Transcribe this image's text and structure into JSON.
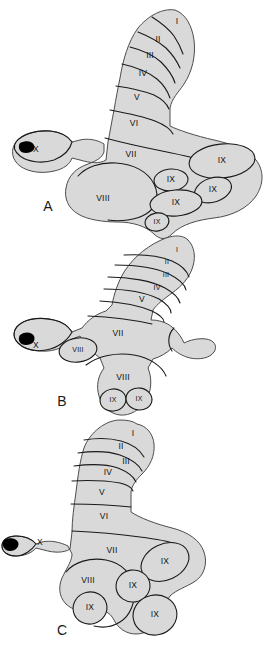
{
  "figure": {
    "background_color": "#ffffff",
    "fill_color": "#d9d9d9",
    "outline_color": "#4d4d4d",
    "fissure_color": "#1a1a1a",
    "nodulus_color": "#000000",
    "label_color": "#111111"
  },
  "panels": [
    {
      "id": "A",
      "label": "A",
      "label_x": 48,
      "label_y": 207,
      "lobules": [
        {
          "name": "I",
          "text": "I",
          "x": 177,
          "y": 22,
          "size": "normal"
        },
        {
          "name": "II",
          "text": "II",
          "x": 158,
          "y": 40,
          "size": "normal"
        },
        {
          "name": "III",
          "text": "III",
          "x": 150,
          "y": 56,
          "size": "normal"
        },
        {
          "name": "IV",
          "text": "IV",
          "x": 143,
          "y": 74,
          "size": "normal"
        },
        {
          "name": "V",
          "text": "V",
          "x": 137,
          "y": 98,
          "size": "normal"
        },
        {
          "name": "VI",
          "text": "VI",
          "x": 134,
          "y": 124,
          "size": "normal"
        },
        {
          "name": "VII",
          "text": "VII",
          "x": 131,
          "y": 155,
          "size": "normal"
        },
        {
          "name": "VIII",
          "text": "VIII",
          "x": 103,
          "y": 199,
          "size": "normal"
        },
        {
          "name": "X",
          "text": "X",
          "x": 36,
          "y": 150,
          "size": "normal"
        },
        {
          "name": "IX-1",
          "text": "IX",
          "x": 222,
          "y": 161,
          "size": "normal"
        },
        {
          "name": "IX-2",
          "text": "IX",
          "x": 171,
          "y": 180,
          "size": "normal"
        },
        {
          "name": "IX-3",
          "text": "IX",
          "x": 213,
          "y": 190,
          "size": "normal"
        },
        {
          "name": "IX-4",
          "text": "IX",
          "x": 176,
          "y": 203,
          "size": "normal"
        },
        {
          "name": "IX-5",
          "text": "IX",
          "x": 157,
          "y": 222,
          "size": "sm"
        }
      ]
    },
    {
      "id": "B",
      "label": "B",
      "label_x": 62,
      "label_y": 402,
      "lobules": [
        {
          "name": "I",
          "text": "I",
          "x": 177,
          "y": 250,
          "size": "sm"
        },
        {
          "name": "II",
          "text": "II",
          "x": 167,
          "y": 262,
          "size": "sm"
        },
        {
          "name": "III",
          "text": "III",
          "x": 166,
          "y": 275,
          "size": "sm"
        },
        {
          "name": "IV",
          "text": "IV",
          "x": 157,
          "y": 288,
          "size": "sm"
        },
        {
          "name": "V",
          "text": "V",
          "x": 142,
          "y": 300,
          "size": "normal"
        },
        {
          "name": "VII",
          "text": "VII",
          "x": 118,
          "y": 334,
          "size": "normal"
        },
        {
          "name": "VIII-1",
          "text": "VIII",
          "x": 78,
          "y": 350,
          "size": "sm"
        },
        {
          "name": "X",
          "text": "X",
          "x": 36,
          "y": 346,
          "size": "normal"
        },
        {
          "name": "VIII-2",
          "text": "VIII",
          "x": 123,
          "y": 378,
          "size": "normal"
        },
        {
          "name": "IX-1",
          "text": "IX",
          "x": 113,
          "y": 400,
          "size": "sm"
        },
        {
          "name": "IX-2",
          "text": "IX",
          "x": 139,
          "y": 399,
          "size": "sm"
        }
      ]
    },
    {
      "id": "C",
      "label": "C",
      "label_x": 62,
      "label_y": 631,
      "lobules": [
        {
          "name": "I",
          "text": "I",
          "x": 133,
          "y": 434,
          "size": "normal"
        },
        {
          "name": "II",
          "text": "II",
          "x": 121,
          "y": 447,
          "size": "normal"
        },
        {
          "name": "III",
          "text": "III",
          "x": 126,
          "y": 462,
          "size": "normal"
        },
        {
          "name": "IV",
          "text": "IV",
          "x": 108,
          "y": 473,
          "size": "normal"
        },
        {
          "name": "V",
          "text": "V",
          "x": 102,
          "y": 493,
          "size": "normal"
        },
        {
          "name": "VI",
          "text": "VI",
          "x": 104,
          "y": 517,
          "size": "normal"
        },
        {
          "name": "VII",
          "text": "VII",
          "x": 112,
          "y": 551,
          "size": "normal"
        },
        {
          "name": "X",
          "text": "X",
          "x": 40,
          "y": 543,
          "size": "normal"
        },
        {
          "name": "VIII",
          "text": "VIII",
          "x": 88,
          "y": 581,
          "size": "normal"
        },
        {
          "name": "IX-1",
          "text": "IX",
          "x": 165,
          "y": 562,
          "size": "normal"
        },
        {
          "name": "IX-2",
          "text": "IX",
          "x": 133,
          "y": 586,
          "size": "normal"
        },
        {
          "name": "IX-3",
          "text": "IX",
          "x": 155,
          "y": 615,
          "size": "normal"
        },
        {
          "name": "IX-4",
          "text": "IX",
          "x": 90,
          "y": 608,
          "size": "normal"
        }
      ]
    }
  ]
}
